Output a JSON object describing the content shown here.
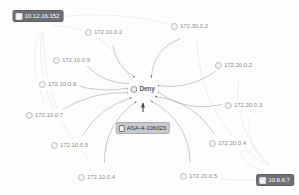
{
  "graph": {
    "title": "Network Event Graph",
    "hub": {
      "id": "deny",
      "label": "Deny",
      "icon": "circle-node-icon",
      "x": 143,
      "y": 89,
      "style": "hub"
    },
    "nodes": [
      {
        "id": "n-10-12-16-152",
        "label": "10.12.16.152",
        "icon": "square-node-icon",
        "x": 38,
        "y": 16,
        "style": "dark"
      },
      {
        "id": "n-172-10-0-2",
        "label": "172.10.0.2",
        "icon": "circle-node-icon",
        "x": 104,
        "y": 32,
        "style": "plain"
      },
      {
        "id": "n-172-30-0-2",
        "label": "172.30.0.2",
        "icon": "circle-node-icon",
        "x": 190,
        "y": 26,
        "style": "plain"
      },
      {
        "id": "n-172-10-0-9",
        "label": "172.10.0.9",
        "icon": "circle-node-icon",
        "x": 72,
        "y": 60,
        "style": "plain"
      },
      {
        "id": "n-172-20-0-2",
        "label": "172.20.0.2",
        "icon": "circle-node-icon",
        "x": 234,
        "y": 65,
        "style": "plain"
      },
      {
        "id": "n-172-10-0-8",
        "label": "172.10.0.8",
        "icon": "circle-node-icon",
        "x": 58,
        "y": 84,
        "style": "plain"
      },
      {
        "id": "n-172-20-0-3",
        "label": "172.20.0.3",
        "icon": "circle-node-icon",
        "x": 244,
        "y": 105,
        "style": "plain"
      },
      {
        "id": "n-172-10-0-7",
        "label": "172.10.0.7",
        "icon": "circle-node-icon",
        "x": 45,
        "y": 115,
        "style": "plain"
      },
      {
        "id": "n-asa-4-106023",
        "label": "ASA-4-106023",
        "icon": "event-node-icon",
        "x": 143,
        "y": 128,
        "style": "chip"
      },
      {
        "id": "n-172-20-0-4",
        "label": "172.20.0.4",
        "icon": "circle-node-icon",
        "x": 228,
        "y": 143,
        "style": "plain"
      },
      {
        "id": "n-172-10-0-5",
        "label": "172.10.0.5",
        "icon": "circle-node-icon",
        "x": 70,
        "y": 145,
        "style": "plain"
      },
      {
        "id": "n-172-10-0-4",
        "label": "172.10.0.4",
        "icon": "circle-node-icon",
        "x": 97,
        "y": 177,
        "style": "plain"
      },
      {
        "id": "n-172-20-0-5",
        "label": "172.20.0.5",
        "icon": "circle-node-icon",
        "x": 199,
        "y": 176,
        "style": "plain"
      },
      {
        "id": "n-10-8-8-7",
        "label": "10.8.8.7",
        "icon": "square-node-icon",
        "x": 275,
        "y": 180,
        "style": "dark"
      }
    ],
    "edges": [
      {
        "from": "n-172-10-0-2",
        "to": "deny",
        "arrow": true,
        "curve": 18,
        "weight": "thin"
      },
      {
        "from": "n-172-30-0-2",
        "to": "deny",
        "arrow": true,
        "curve": 26,
        "weight": "thin"
      },
      {
        "from": "n-172-10-0-9",
        "to": "deny",
        "arrow": true,
        "curve": 16,
        "weight": "thin"
      },
      {
        "from": "n-172-20-0-2",
        "to": "deny",
        "arrow": true,
        "curve": -20,
        "weight": "thin"
      },
      {
        "from": "n-172-10-0-8",
        "to": "deny",
        "arrow": true,
        "curve": 10,
        "weight": "thin"
      },
      {
        "from": "n-172-20-0-3",
        "to": "deny",
        "arrow": true,
        "curve": -26,
        "weight": "thin"
      },
      {
        "from": "n-172-10-0-7",
        "to": "deny",
        "arrow": true,
        "curve": -16,
        "weight": "thin"
      },
      {
        "from": "n-172-20-0-4",
        "to": "deny",
        "arrow": true,
        "curve": 24,
        "weight": "thin"
      },
      {
        "from": "n-172-10-0-5",
        "to": "deny",
        "arrow": true,
        "curve": -18,
        "weight": "thin"
      },
      {
        "from": "n-172-10-0-4",
        "to": "deny",
        "arrow": true,
        "curve": -26,
        "weight": "thin"
      },
      {
        "from": "n-172-20-0-5",
        "to": "deny",
        "arrow": true,
        "curve": 30,
        "weight": "thin"
      },
      {
        "from": "n-asa-4-106023",
        "to": "deny",
        "arrow": true,
        "curve": 0,
        "weight": "bold"
      },
      {
        "from": "n-10-12-16-152",
        "to": "deny",
        "arrow": false,
        "curve": -42,
        "weight": "faint"
      },
      {
        "from": "n-10-12-16-152",
        "to": "n-172-30-0-2",
        "arrow": false,
        "curve": -14,
        "weight": "faint"
      },
      {
        "from": "n-10-12-16-152",
        "to": "n-172-10-0-4",
        "arrow": false,
        "curve": 34,
        "weight": "faint"
      },
      {
        "from": "n-10-12-16-152",
        "to": "n-172-10-0-5",
        "arrow": false,
        "curve": 26,
        "weight": "faint"
      },
      {
        "from": "n-10-12-16-152",
        "to": "n-172-10-0-7",
        "arrow": false,
        "curve": 20,
        "weight": "faint"
      },
      {
        "from": "n-10-8-8-7",
        "to": "n-172-20-0-2",
        "arrow": false,
        "curve": -30,
        "weight": "faint"
      },
      {
        "from": "n-10-8-8-7",
        "to": "n-172-20-0-3",
        "arrow": false,
        "curve": -22,
        "weight": "faint"
      },
      {
        "from": "n-10-8-8-7",
        "to": "n-172-20-0-4",
        "arrow": false,
        "curve": -16,
        "weight": "faint"
      },
      {
        "from": "n-10-8-8-7",
        "to": "n-172-20-0-5",
        "arrow": false,
        "curve": -8,
        "weight": "faint"
      },
      {
        "from": "n-10-8-8-7",
        "to": "n-172-30-0-2",
        "arrow": false,
        "curve": -46,
        "weight": "faint"
      }
    ]
  },
  "colors": {
    "edge": "#9a9da2",
    "edge_faint": "#d3d5d9",
    "node_text": "#8b8d92",
    "selected_bg": "#6f7176",
    "chip_bg": "#c9cbcf",
    "background": "#fdfdfd"
  }
}
